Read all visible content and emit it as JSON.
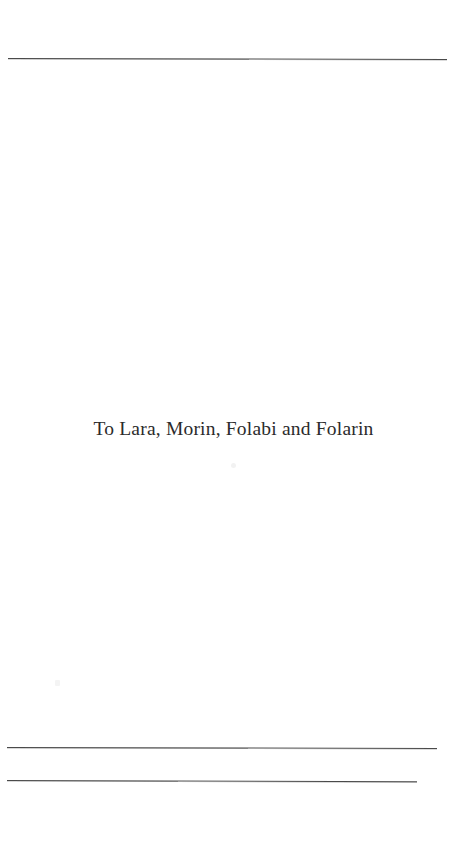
{
  "page": {
    "background_color": "#ffffff",
    "width": 459,
    "height": 862,
    "type": "scanned-book-dedication-page"
  },
  "dedication": {
    "text": "To Lara, Morin, Folabi and Folarin",
    "color": "#2b2b2b"
  },
  "rules": {
    "top": {
      "name": "top-horizontal-rule",
      "color": "#4a4a4a"
    },
    "bottom_first": {
      "name": "bottom-horizontal-rule-upper",
      "color": "#4a4a4a"
    },
    "bottom_second": {
      "name": "bottom-horizontal-rule-lower",
      "color": "#4a4a4a"
    }
  },
  "artifacts": {
    "speck_one": "scan-speck",
    "speck_two": "scan-speck"
  }
}
